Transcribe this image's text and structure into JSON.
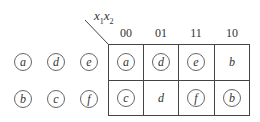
{
  "variables": {
    "x1": "x",
    "sub1": "1",
    "x2": "x",
    "sub2": "2"
  },
  "column_headers": [
    "00",
    "01",
    "11",
    "10"
  ],
  "left_states": {
    "row1": [
      "a",
      "d",
      "e"
    ],
    "row2": [
      "b",
      "c",
      "f"
    ]
  },
  "map_cells": {
    "row1": [
      {
        "label": "a",
        "circled": true
      },
      {
        "label": "d",
        "circled": true
      },
      {
        "label": "e",
        "circled": true
      },
      {
        "label": "b",
        "circled": false
      }
    ],
    "row2": [
      {
        "label": "c",
        "circled": true
      },
      {
        "label": "d",
        "circled": false
      },
      {
        "label": "f",
        "circled": true
      },
      {
        "label": "b",
        "circled": true
      }
    ]
  }
}
